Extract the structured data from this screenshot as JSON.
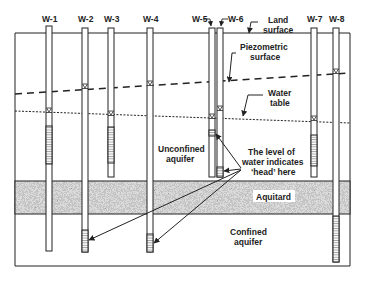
{
  "colors": {
    "line": "#222222",
    "aquitard": "#8a8a8a",
    "background": "#ffffff"
  },
  "wells": [
    {
      "label": "W-1",
      "x": 49,
      "top": 26,
      "bottom": 251,
      "screen_top": 126,
      "screen_bottom": 164,
      "water": 111
    },
    {
      "label": "W-2",
      "x": 85,
      "top": 28,
      "bottom": 252,
      "screen_top": 230,
      "screen_bottom": 252,
      "water": 87
    },
    {
      "label": "W-3",
      "x": 111,
      "top": 28,
      "bottom": 177,
      "screen_top": 127,
      "screen_bottom": 163,
      "water": 114
    },
    {
      "label": "W-4",
      "x": 150,
      "top": 28,
      "bottom": 252,
      "screen_top": 234,
      "screen_bottom": 252,
      "water": 84
    },
    {
      "label": "W-5",
      "x": 212,
      "top": 28,
      "bottom": 177,
      "screen_top": 130,
      "screen_bottom": 136,
      "water": 117
    },
    {
      "label": "W-6",
      "x": 220,
      "top": 28,
      "bottom": 177,
      "screen_top": 167,
      "screen_bottom": 177,
      "water": 109
    },
    {
      "label": "W-7",
      "x": 314,
      "top": 28,
      "bottom": 177,
      "screen_top": 135,
      "screen_bottom": 166,
      "water": 119
    },
    {
      "label": "W-8",
      "x": 336,
      "top": 28,
      "bottom": 262,
      "screen_top": 216,
      "screen_bottom": 262,
      "water": 72
    }
  ],
  "labels": {
    "land_surface": [
      "Land",
      "surface"
    ],
    "piezometric_surface": [
      "Piezometric",
      "surface"
    ],
    "water_table": [
      "Water",
      "table"
    ],
    "unconfined_aquifer": [
      "Unconfined",
      "aquifer"
    ],
    "head_note": [
      "The level of",
      "water indicates",
      "‘head’ here"
    ],
    "aquitard": "Aquitard",
    "confined_aquifer": [
      "Confined",
      "aquifer"
    ]
  }
}
